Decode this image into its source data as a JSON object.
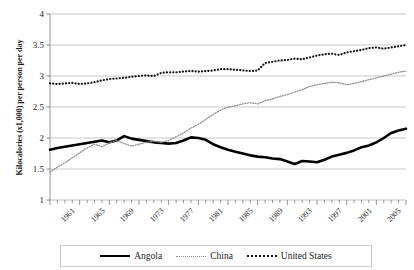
{
  "chart_data": {
    "type": "line",
    "title": "",
    "xlabel": "",
    "ylabel": "Kilocalories (x1,000) per person per day",
    "ylim": [
      1,
      4
    ],
    "yticks": [
      1,
      1.5,
      2,
      2.5,
      3,
      3.5,
      4
    ],
    "ytick_labels": [
      "1",
      "1.5",
      "2",
      "2.5",
      "3",
      "3.5",
      "4"
    ],
    "xlim": [
      1961,
      2009
    ],
    "xticks": [
      1961,
      1965,
      1969,
      1973,
      1977,
      1981,
      1985,
      1989,
      1993,
      1997,
      2001,
      2005,
      2009
    ],
    "xtick_labels": [
      "1961",
      "1965",
      "1969",
      "1973",
      "1977",
      "1981",
      "1985",
      "1989",
      "1993",
      "1997",
      "2001",
      "2005",
      "2009"
    ],
    "x": [
      1961,
      1962,
      1963,
      1964,
      1965,
      1966,
      1967,
      1968,
      1969,
      1970,
      1971,
      1972,
      1973,
      1974,
      1975,
      1976,
      1977,
      1978,
      1979,
      1980,
      1981,
      1982,
      1983,
      1984,
      1985,
      1986,
      1987,
      1988,
      1989,
      1990,
      1991,
      1992,
      1993,
      1994,
      1995,
      1996,
      1997,
      1998,
      1999,
      2000,
      2001,
      2002,
      2003,
      2004,
      2005,
      2006,
      2007,
      2008,
      2009
    ],
    "grid": true,
    "legend_position": "bottom",
    "series": [
      {
        "name": "Angola",
        "style": "solid",
        "color": "#000000",
        "width": 2.6,
        "values": [
          1.81,
          1.84,
          1.86,
          1.88,
          1.9,
          1.92,
          1.94,
          1.96,
          1.93,
          1.96,
          2.03,
          1.99,
          1.97,
          1.95,
          1.93,
          1.92,
          1.91,
          1.92,
          1.96,
          2.01,
          2.0,
          1.97,
          1.9,
          1.85,
          1.81,
          1.78,
          1.75,
          1.72,
          1.7,
          1.69,
          1.67,
          1.66,
          1.62,
          1.58,
          1.63,
          1.62,
          1.61,
          1.65,
          1.7,
          1.73,
          1.76,
          1.8,
          1.85,
          1.88,
          1.93,
          2.0,
          2.08,
          2.12,
          2.15
        ]
      },
      {
        "name": "China",
        "style": "fine-dotted",
        "color": "#8d8d8d",
        "width": 1.3,
        "values": [
          1.45,
          1.53,
          1.6,
          1.68,
          1.76,
          1.84,
          1.9,
          1.86,
          1.92,
          1.96,
          1.91,
          1.87,
          1.9,
          1.93,
          1.95,
          1.93,
          1.96,
          2.02,
          2.08,
          2.16,
          2.22,
          2.3,
          2.38,
          2.45,
          2.5,
          2.52,
          2.55,
          2.57,
          2.55,
          2.6,
          2.63,
          2.67,
          2.7,
          2.74,
          2.78,
          2.83,
          2.86,
          2.88,
          2.9,
          2.89,
          2.86,
          2.88,
          2.91,
          2.94,
          2.97,
          3.0,
          3.03,
          3.06,
          3.08
        ]
      },
      {
        "name": "United States",
        "style": "coarse-dotted",
        "color": "#111111",
        "width": 2.2,
        "values": [
          2.88,
          2.87,
          2.88,
          2.89,
          2.87,
          2.88,
          2.9,
          2.93,
          2.95,
          2.96,
          2.97,
          2.99,
          3.0,
          3.01,
          3.0,
          3.05,
          3.06,
          3.06,
          3.07,
          3.08,
          3.07,
          3.08,
          3.09,
          3.11,
          3.11,
          3.1,
          3.09,
          3.08,
          3.09,
          3.21,
          3.23,
          3.25,
          3.26,
          3.28,
          3.27,
          3.3,
          3.33,
          3.35,
          3.36,
          3.34,
          3.38,
          3.4,
          3.42,
          3.45,
          3.46,
          3.44,
          3.46,
          3.48,
          3.5
        ]
      }
    ]
  },
  "legend": {
    "items": [
      {
        "label": "Angola",
        "marker": "solid-line-marker"
      },
      {
        "label": "China",
        "marker": "fine-dotted-line-marker"
      },
      {
        "label": "United States",
        "marker": "coarse-dotted-line-marker"
      }
    ]
  },
  "axis": {
    "ylabel_text": "Kilocalories (x1,000) per person per day"
  }
}
